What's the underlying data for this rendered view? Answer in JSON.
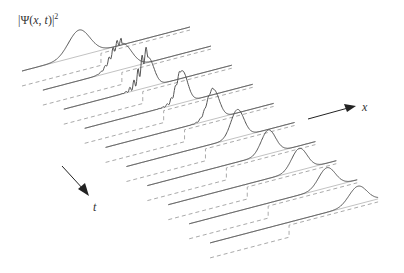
{
  "chart_data": {
    "type": "line",
    "subtype": "waterfall",
    "title": "",
    "ylabel": "|Ψ(x, t)|²",
    "xlabel": "x",
    "tlabel": "t",
    "legend": [],
    "grid": false,
    "series_count": 10,
    "step_position_fraction": 0.47,
    "series": [
      {
        "name": "t0",
        "peak_x": 0.34,
        "peak_h": 26,
        "width": 0.09,
        "ripple": 0
      },
      {
        "name": "t1",
        "peak_x": 0.47,
        "peak_h": 26,
        "width": 0.08,
        "ripple": 0.6
      },
      {
        "name": "t2",
        "peak_x": 0.5,
        "peak_h": 30,
        "width": 0.05,
        "ripple": 1.0
      },
      {
        "name": "t3",
        "peak_x": 0.58,
        "peak_h": 32,
        "width": 0.045,
        "ripple": 0.3
      },
      {
        "name": "t4",
        "peak_x": 0.64,
        "peak_h": 30,
        "width": 0.05,
        "ripple": 0.15
      },
      {
        "name": "t5",
        "peak_x": 0.66,
        "peak_h": 28,
        "width": 0.055,
        "ripple": 0
      },
      {
        "name": "t6",
        "peak_x": 0.72,
        "peak_h": 24,
        "width": 0.06,
        "ripple": 0
      },
      {
        "name": "t7",
        "peak_x": 0.78,
        "peak_h": 22,
        "width": 0.065,
        "ripple": 0
      },
      {
        "name": "t8",
        "peak_x": 0.82,
        "peak_h": 20,
        "width": 0.07,
        "ripple": 0
      },
      {
        "name": "t9",
        "peak_x": 0.88,
        "peak_h": 18,
        "width": 0.075,
        "ripple": 0
      }
    ],
    "colors": {
      "trace": "#555555",
      "baseline": "#333333",
      "potential": "#aaaaaa",
      "arrow": "#222222"
    }
  },
  "labels": {
    "psi_prefix": "|Ψ(",
    "psi_x": "x",
    "psi_sep": ", ",
    "psi_t": "t",
    "psi_suffix": ")|",
    "psi_exp": "2",
    "x_axis": "x",
    "t_axis": "t"
  }
}
